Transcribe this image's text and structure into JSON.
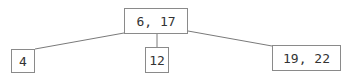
{
  "diagram": {
    "type": "b-tree",
    "colors": {
      "border": "#8a8a8a",
      "edge": "#7a7a7a",
      "text": "#333333",
      "background": "#ffffff"
    },
    "root": {
      "keys": [
        6,
        17
      ],
      "label": "6, 17"
    },
    "children": [
      {
        "keys": [
          4
        ],
        "label": "4"
      },
      {
        "keys": [
          12
        ],
        "label": "12"
      },
      {
        "keys": [
          19,
          22
        ],
        "label": "19, 22"
      }
    ],
    "edges": [
      {
        "from": "root",
        "to": "children.0"
      },
      {
        "from": "root",
        "to": "children.1"
      },
      {
        "from": "root",
        "to": "children.2"
      }
    ]
  }
}
